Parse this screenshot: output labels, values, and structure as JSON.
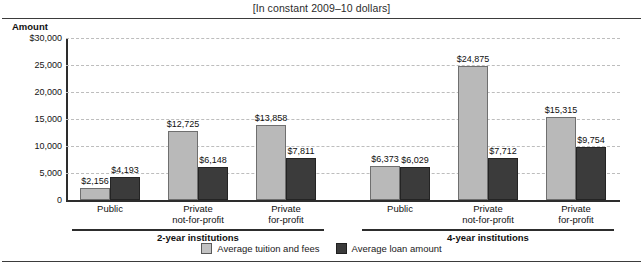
{
  "subtitle": "[In constant 2009–10 dollars]",
  "axis": {
    "y_title": "Amount",
    "yticks": [
      "$30,000",
      "25,000",
      "20,000",
      "15,000",
      "10,000",
      "5,000",
      "0"
    ]
  },
  "legend": {
    "items": [
      {
        "label": "Average tuition and fees",
        "swatch": "tuition",
        "color": "#c2c2c2"
      },
      {
        "label": "Average loan amount",
        "swatch": "loan",
        "color": "#3b3b3b"
      }
    ]
  },
  "groups": [
    {
      "label": "2-year institutions"
    },
    {
      "label": "4-year institutions"
    }
  ],
  "chart_data": {
    "type": "bar",
    "title": "",
    "subtitle": "[In constant 2009–10 dollars]",
    "xlabel": "",
    "ylabel": "Amount",
    "ylim": [
      0,
      30000
    ],
    "yticks": [
      0,
      5000,
      10000,
      15000,
      20000,
      25000,
      30000
    ],
    "ytick_labels": [
      "0",
      "5,000",
      "10,000",
      "15,000",
      "20,000",
      "25,000",
      "$30,000"
    ],
    "grid": true,
    "legend_position": "bottom-center",
    "categories": [
      "Public",
      "Private not-for-profit",
      "Private for-profit",
      "Public",
      "Private not-for-profit",
      "Private for-profit"
    ],
    "category_lines": [
      [
        "Public"
      ],
      [
        "Private",
        "not-for-profit"
      ],
      [
        "Private",
        "for-profit"
      ],
      [
        "Public"
      ],
      [
        "Private",
        "not-for-profit"
      ],
      [
        "Private",
        "for-profit"
      ]
    ],
    "group_spans": [
      {
        "label": "2-year institutions",
        "categories": [
          0,
          1,
          2
        ]
      },
      {
        "label": "4-year institutions",
        "categories": [
          3,
          4,
          5
        ]
      }
    ],
    "series": [
      {
        "name": "Average tuition and fees",
        "color": "#b9b9b9",
        "values": [
          2156,
          12725,
          13858,
          6373,
          24875,
          15315
        ],
        "labels": [
          "$2,156",
          "$12,725",
          "$13,858",
          "$6,373",
          "$24,875",
          "$15,315"
        ]
      },
      {
        "name": "Average loan amount",
        "color": "#3b3b3b",
        "values": [
          4193,
          6148,
          7811,
          6029,
          7712,
          9754
        ],
        "labels": [
          "$4,193",
          "$6,148",
          "$7,811",
          "$6,029",
          "$7,712",
          "$9,754"
        ]
      }
    ]
  }
}
